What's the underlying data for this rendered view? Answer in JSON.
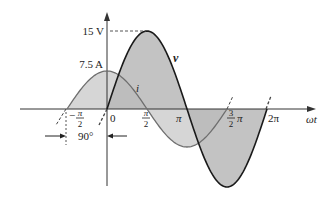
{
  "diagram": {
    "type": "phasor-waveform",
    "x_axis_label": "ωt",
    "y_axis_arrow": true,
    "voltage": {
      "name": "v",
      "peak_label": "15 V",
      "peak_value": 15,
      "phase_deg": 0,
      "stroke_color": "#1a1a1a",
      "fill_color": "#b9b9b9"
    },
    "current": {
      "name": "i",
      "peak_label": "7.5 A",
      "peak_value": 7.5,
      "phase_deg": 90,
      "stroke_color": "#6e6e6e",
      "fill_color": "#d6d6d6"
    },
    "ticks": [
      {
        "label": "0",
        "pos": 0
      },
      {
        "label": "π",
        "pos": 2
      },
      {
        "label": "2π",
        "pos": 4
      }
    ],
    "fraction_ticks": [
      {
        "sign": "−",
        "num": "π",
        "den": "2",
        "pos": -1
      },
      {
        "sign": "",
        "num": "π",
        "den": "2",
        "pos": 1
      },
      {
        "sign": "",
        "num": "3",
        "den": "2",
        "suffix": "π",
        "pos": 3
      }
    ],
    "phase_shift_label": "90°",
    "axis_color": "#333333",
    "dash_color": "#444444"
  }
}
